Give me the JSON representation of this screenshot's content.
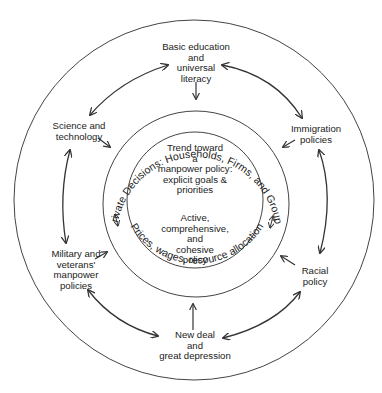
{
  "diagram": {
    "type": "concentric-circles",
    "colors": {
      "line": "#333333",
      "text": "#222222",
      "background": "#ffffff"
    },
    "inner_circle": {
      "top_text": "Trend toward\na\nmanpower policy:\nexplicit goals &\npriorities",
      "bottom_text": "Active,\ncomprehensive,\nand\ncohesive\npolicy"
    },
    "middle_ring": {
      "top_arc_text": "Private Decisions: Households, Firms, and Groups",
      "bottom_arc_text": "Prices, wages,  resource allocation"
    },
    "outer_nodes": {
      "top": "Basic education\nand\nuniversal\nliteracy",
      "upper_left": "Science and\ntechnology",
      "upper_right": "Immigration\npolicies",
      "lower_left": "Military and\nveterans'\nmanpower\npolicies",
      "lower_right": "Racial\npolicy",
      "bottom": "New deal\nand\ngreat depression"
    },
    "connections": [
      {
        "from": "Basic education and universal literacy",
        "to": "Science and technology",
        "type": "bidirectional"
      },
      {
        "from": "Basic education and universal literacy",
        "to": "Immigration policies",
        "type": "bidirectional"
      },
      {
        "from": "Science and technology",
        "to": "Military and veterans' manpower policies",
        "type": "bidirectional"
      },
      {
        "from": "Immigration policies",
        "to": "Racial policy",
        "type": "bidirectional"
      },
      {
        "from": "Military and veterans' manpower policies",
        "to": "New deal and great depression",
        "type": "bidirectional"
      },
      {
        "from": "Racial policy",
        "to": "New deal and great depression",
        "type": "bidirectional"
      },
      {
        "from": "all outer nodes",
        "to": "Private Decisions ring",
        "type": "inward"
      },
      {
        "from": "Private Decisions ring",
        "to": "inner circle",
        "type": "bidirectional-small"
      }
    ]
  }
}
